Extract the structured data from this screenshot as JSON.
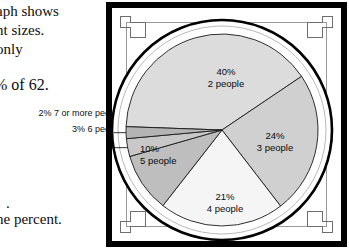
{
  "page": {
    "background": "#ffffff",
    "body_text_lines": [
      "aph shows",
      "nt sizes.",
      "only",
      "% of 62.",
      ".",
      "he percent."
    ]
  },
  "frame": {
    "border_color": "#000000",
    "inner_frame_color": "#9a9a9a",
    "corner_bracket_color": "#6e6e6e",
    "ring_color": "#ffffff",
    "ring_outline_color": "#000000"
  },
  "callouts": [
    {
      "percent": "2%",
      "label": "7 or more people",
      "text": "2% 7 or more people"
    },
    {
      "percent": "3%",
      "label": "6 people",
      "text": "3% 6 people"
    }
  ],
  "chart_data": {
    "type": "pie",
    "title": "",
    "subtitle": "",
    "xlabel": "",
    "ylabel": "",
    "legend_position": "none",
    "grid": false,
    "total_label": "62",
    "units": "percent",
    "categories": [
      "2 people",
      "3 people",
      "4 people",
      "5 people",
      "6 people",
      "7 or more people"
    ],
    "values": [
      40,
      24,
      21,
      10,
      3,
      2
    ],
    "labels": [
      {
        "percent": "40%",
        "people": "2 people",
        "value": 40,
        "color": "#dcdcdc",
        "callout": false
      },
      {
        "percent": "24%",
        "people": "3 people",
        "value": 24,
        "color": "#d0d0d0",
        "callout": false
      },
      {
        "percent": "21%",
        "people": "4 people",
        "value": 21,
        "color": "#f5f5f5",
        "callout": false
      },
      {
        "percent": "10%",
        "people": "5 people",
        "value": 10,
        "color": "#bebebe",
        "callout": false
      },
      {
        "percent": "3%",
        "people": "6 people",
        "value": 3,
        "color": "#c8c8c8",
        "callout": true
      },
      {
        "percent": "2%",
        "people": "7 or more people",
        "value": 2,
        "color": "#b4b4b4",
        "callout": true
      }
    ],
    "slice_colors": [
      "#dcdcdc",
      "#d0d0d0",
      "#f5f5f5",
      "#bebebe",
      "#c8c8c8",
      "#b4b4b4"
    ],
    "outline_color": "#1a1a1a"
  }
}
